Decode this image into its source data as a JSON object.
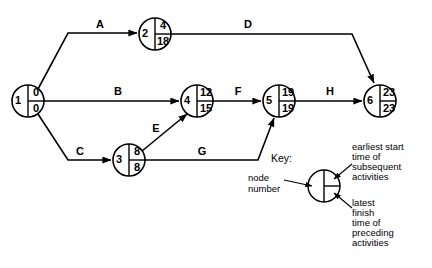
{
  "diagram": {
    "type": "activity-on-arrow-network",
    "title": "",
    "nodes": [
      {
        "id": "n1",
        "number": "1",
        "earliest_start": "0",
        "latest_finish": "0",
        "cx": 28,
        "cy": 101,
        "r": 16
      },
      {
        "id": "n2",
        "number": "2",
        "earliest_start": "4",
        "latest_finish": "18",
        "cx": 155,
        "cy": 34,
        "r": 16
      },
      {
        "id": "n3",
        "number": "3",
        "earliest_start": "8",
        "latest_finish": "8",
        "cx": 129,
        "cy": 160,
        "r": 16
      },
      {
        "id": "n4",
        "number": "4",
        "earliest_start": "12",
        "latest_finish": "15",
        "cx": 197,
        "cy": 101,
        "r": 16
      },
      {
        "id": "n5",
        "number": "5",
        "earliest_start": "19",
        "latest_finish": "19",
        "cx": 279,
        "cy": 101,
        "r": 16
      },
      {
        "id": "n6",
        "number": "6",
        "earliest_start": "23",
        "latest_finish": "23",
        "cx": 380,
        "cy": 101,
        "r": 16
      }
    ],
    "activities": [
      {
        "id": "A",
        "label": "A",
        "from": "1",
        "to": "2",
        "label_x": 100,
        "label_y": 25
      },
      {
        "id": "B",
        "label": "B",
        "from": "1",
        "to": "4",
        "label_x": 118,
        "label_y": 92
      },
      {
        "id": "C",
        "label": "C",
        "from": "1",
        "to": "3",
        "label_x": 80,
        "label_y": 152
      },
      {
        "id": "D",
        "label": "D",
        "from": "2",
        "to": "6",
        "label_x": 248,
        "label_y": 25
      },
      {
        "id": "E",
        "label": "E",
        "from": "3",
        "to": "4",
        "label_x": 156,
        "label_y": 129
      },
      {
        "id": "F",
        "label": "F",
        "from": "4",
        "to": "5",
        "label_x": 238,
        "label_y": 92
      },
      {
        "id": "G",
        "label": "G",
        "from": "3",
        "to": "5",
        "label_x": 202,
        "label_y": 152
      },
      {
        "id": "H",
        "label": "H",
        "from": "5",
        "to": "6",
        "label_x": 330,
        "label_y": 92
      }
    ]
  },
  "key": {
    "title": "Key:",
    "node_number_label_line1": "node",
    "node_number_label_line2": "number",
    "earliest_caption_lines": [
      "earliest start",
      "time of",
      "subsequent",
      "activities"
    ],
    "latest_caption_lines": [
      "latest",
      "finish",
      "time of",
      "preceding",
      "activities"
    ]
  },
  "colors": {
    "ink": "#000000",
    "background": "#ffffff"
  }
}
